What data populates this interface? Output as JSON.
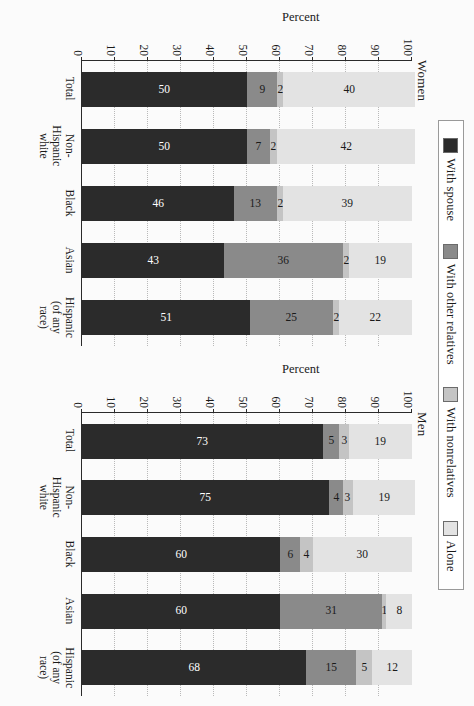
{
  "legend": {
    "items": [
      {
        "label": "With spouse",
        "color": "#2b2b2b",
        "key": "spouse"
      },
      {
        "label": "With other relatives",
        "color": "#8a8a8a",
        "key": "relatives"
      },
      {
        "label": "With nonrelatives",
        "color": "#c4c4c4",
        "key": "nonrel"
      },
      {
        "label": "Alone",
        "color": "#e3e3e3",
        "key": "alone"
      }
    ]
  },
  "axis": {
    "title": "Percent",
    "ticks": [
      "0",
      "10",
      "20",
      "30",
      "40",
      "50",
      "60",
      "70",
      "80",
      "90",
      "100"
    ],
    "min": 0,
    "max": 100
  },
  "chart_data": {
    "type": "bar",
    "title": "",
    "xlabel": "",
    "ylabel": "Percent",
    "ylim": [
      0,
      100
    ],
    "grid": true,
    "stacked": true,
    "legend_position": "top",
    "panels": [
      {
        "name": "Men",
        "categories": [
          "Total",
          "Non-Hispanic white",
          "Black",
          "Asian",
          "Hispanic (of any race)"
        ],
        "series": [
          {
            "name": "With spouse",
            "values": [
              73,
              75,
              60,
              60,
              68
            ]
          },
          {
            "name": "With other relatives",
            "values": [
              5,
              4,
              6,
              31,
              15
            ]
          },
          {
            "name": "With nonrelatives",
            "values": [
              3,
              3,
              4,
              1,
              5
            ]
          },
          {
            "name": "Alone",
            "values": [
              19,
              19,
              30,
              8,
              12
            ]
          }
        ]
      },
      {
        "name": "Women",
        "categories": [
          "Total",
          "Non-Hispanic white",
          "Black",
          "Asian",
          "Hispanic (of any race)"
        ],
        "series": [
          {
            "name": "With spouse",
            "values": [
              50,
              50,
              46,
              43,
              51
            ]
          },
          {
            "name": "With other relatives",
            "values": [
              9,
              7,
              13,
              36,
              25
            ]
          },
          {
            "name": "With nonrelatives",
            "values": [
              2,
              2,
              2,
              2,
              2
            ]
          },
          {
            "name": "Alone",
            "values": [
              40,
              42,
              39,
              19,
              22
            ]
          }
        ]
      }
    ],
    "category_label_lines": [
      [
        "Total",
        ""
      ],
      [
        "Non-Hispanic",
        "white"
      ],
      [
        "Black",
        ""
      ],
      [
        "Asian",
        ""
      ],
      [
        "Hispanic",
        "(of any race)"
      ]
    ]
  }
}
